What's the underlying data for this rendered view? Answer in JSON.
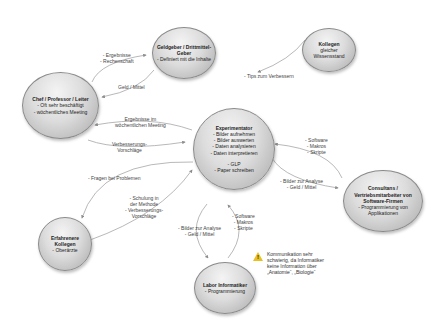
{
  "nodes": {
    "geldgeber": {
      "title": "Geldgeber / Drittmittel-Geber",
      "lines": [
        "- Definiert mit die Inhalte"
      ]
    },
    "kollegen": {
      "title": "Kollegen",
      "lines": [
        "gleicher",
        "Wissensstand"
      ]
    },
    "chef": {
      "title": "Chef / Professor / Leiter",
      "lines": [
        "- Oft sehr beschäftigt",
        "- wöchentliches Meeting"
      ]
    },
    "experimentator": {
      "title": "Experimentator",
      "lines": [
        "- Bilder aufnehmen",
        "- Bilder auswerten",
        "- Daten analysieren",
        "- Daten interpretieren",
        "",
        "- GLP",
        "- Paper schreiben"
      ]
    },
    "consultans": {
      "title": "Consultans / Vertriebsmitarbeiter von Software-Firmen",
      "lines": [
        "- Programmierung von",
        "Applikationen"
      ]
    },
    "erfahrene": {
      "title": "Erfahrenere Kollegen",
      "lines": [
        "- Oberärzte"
      ]
    },
    "labor": {
      "title": "Labor Informatiker",
      "lines": [
        "- Programmierung"
      ]
    }
  },
  "edges": {
    "chef_to_geldgeber": [
      "- Ergebnisse",
      "- Rechenschaft"
    ],
    "geldgeber_to_chef": [
      "Geld / Mittel"
    ],
    "kollegen_to_exp": [
      "- Tips zum Verbessern"
    ],
    "exp_to_chef": [
      "Ergebnisse im",
      "wöchentlichen Meeting"
    ],
    "chef_to_exp": [
      "Verbesserungs-",
      "Vorschläge"
    ],
    "exp_to_erfahrene": [
      "- Fragen bei Problemen"
    ],
    "erfahrene_to_exp": [
      "- Schulung in",
      "der Methode",
      "- Verbesserungs-",
      "Vorschläge"
    ],
    "consultans_to_exp": [
      "- Software",
      "- Makros",
      "- Skripte"
    ],
    "exp_to_consultans": [
      "- Bilder zur Analyse",
      "- Geld / Mittel"
    ],
    "exp_to_labor": [
      "- Bilder zur Analyse",
      "- Geld / Mittel"
    ],
    "labor_to_exp": [
      "- Software",
      "- Makros",
      "- Skripte"
    ]
  },
  "warning": {
    "icon": "warning-icon",
    "symbol": "!",
    "lines": [
      "Kommunikation sehr",
      "schwierig, da Informatiker",
      "keine Information über",
      "„Anatomie“, „Biologie“"
    ]
  },
  "colors": {
    "edge": "#8c8c8c",
    "warning": "#e8c020"
  }
}
